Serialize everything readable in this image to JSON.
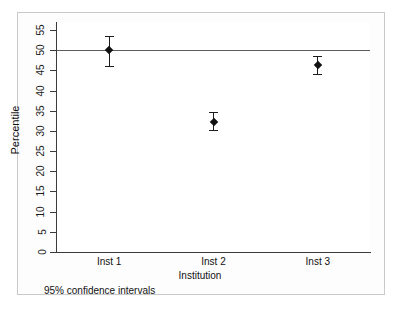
{
  "chart_data": {
    "type": "scatter",
    "title": "",
    "xlabel": "Institution",
    "ylabel": "Percentile",
    "categories": [
      "Inst 1",
      "Inst 2",
      "Inst 3"
    ],
    "values": [
      50.0,
      32.3,
      46.3
    ],
    "ci_lower": [
      46.0,
      30.2,
      44.0
    ],
    "ci_upper": [
      53.5,
      34.6,
      48.5
    ],
    "ylim": [
      0,
      57
    ],
    "yticks": [
      0,
      5,
      10,
      15,
      20,
      25,
      30,
      35,
      40,
      45,
      50,
      55
    ],
    "ytick_labels": [
      "0",
      "5",
      "10",
      "15",
      "20",
      "25",
      "30",
      "35",
      "40",
      "45",
      "50",
      "55"
    ],
    "reference_line": 50,
    "grid": false,
    "legend": "none",
    "annotation": "95% confidence intervals",
    "series": [
      {
        "name": "Percentile",
        "points": [
          {
            "category": "Inst 1",
            "value": 50.0,
            "lower": 46.0,
            "upper": 53.5
          },
          {
            "category": "Inst 2",
            "value": 32.3,
            "lower": 30.2,
            "upper": 34.6
          },
          {
            "category": "Inst 3",
            "value": 46.3,
            "lower": 44.0,
            "upper": 48.5
          }
        ]
      }
    ],
    "colors": {
      "marker": "#111111",
      "error_bar": "#1c1c1c",
      "reference_line": "#5d5d5d",
      "axis": "#3a3a3a",
      "frame": "#c9c9c9",
      "background": "#ffffff"
    }
  },
  "footnote": "95% confidence intervals"
}
